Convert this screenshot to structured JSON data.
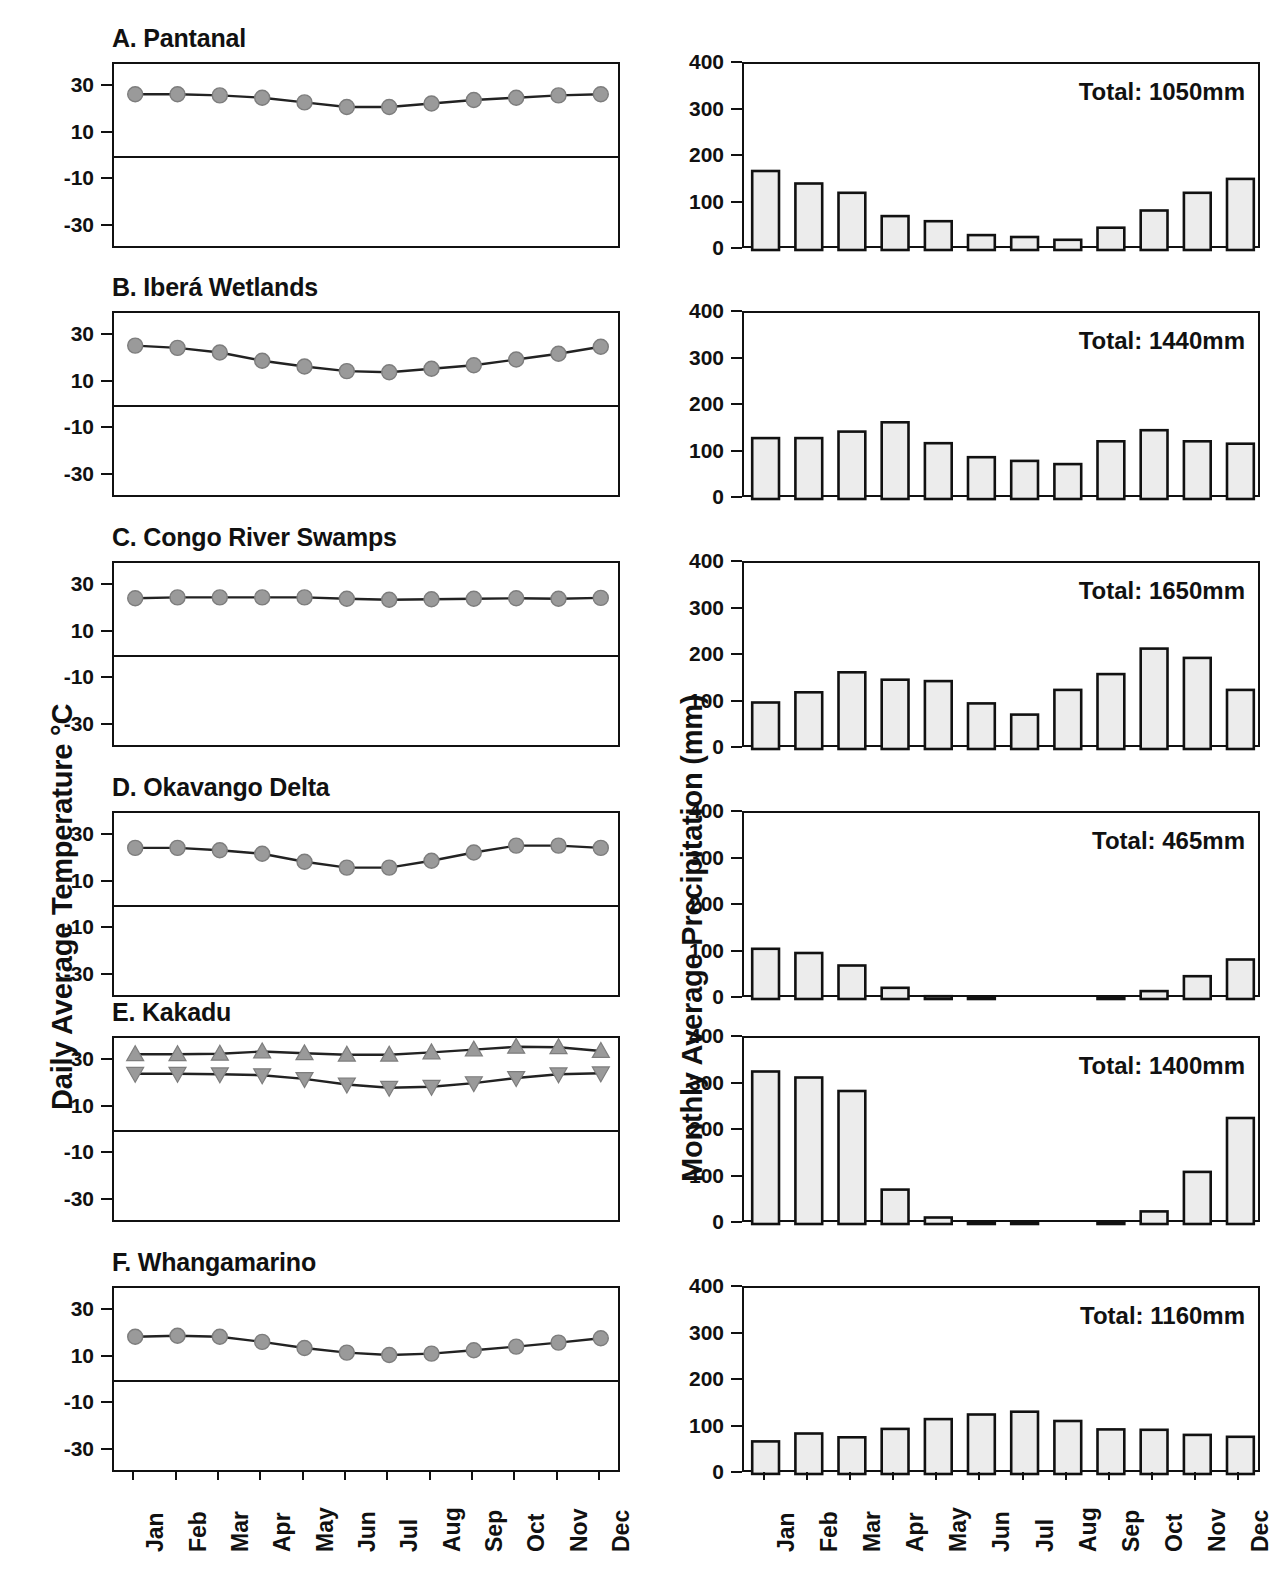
{
  "figure": {
    "temperature_axis_title": "Daily Average Temperature °C",
    "precipitation_axis_title": "Monthly Average Precipitation (mm)",
    "months": [
      "Jan",
      "Feb",
      "Mar",
      "Apr",
      "May",
      "Jun",
      "Jul",
      "Aug",
      "Sep",
      "Oct",
      "Nov",
      "Dec"
    ],
    "temp_ticks": [
      30,
      10,
      -10,
      -30
    ],
    "temp_tick_labels": [
      "30",
      "10",
      "-10",
      "-30"
    ],
    "precip_ticks": [
      400,
      300,
      200,
      100,
      0
    ],
    "precip_tick_labels": [
      "400",
      "300",
      "200",
      "100",
      "0"
    ],
    "temp_ylim": [
      -40,
      40
    ],
    "precip_ylim": [
      0,
      400
    ],
    "marker_color": "#9a9a9a",
    "line_color": "#222222",
    "bar_fill": "#ececec",
    "bar_edge": "#111111",
    "panel_titles": {
      "a": "A. Pantanal",
      "b": "B. Iberá Wetlands",
      "c": "C. Congo River Swamps",
      "d": "D. Okavango Delta",
      "e": "E. Kakadu",
      "f": "F. Whangamarino"
    },
    "totals": {
      "a": "Total:  1050mm",
      "b": "Total:  1440mm",
      "c": "Total:  1650mm",
      "d": "Total:  465mm",
      "e": "Total:  1400mm",
      "f": "Total:  1160mm"
    }
  },
  "chart_data": [
    {
      "type": "line",
      "panel": "A",
      "title": "A. Pantanal",
      "ylabel": "Daily Average Temperature °C",
      "xlabel": "",
      "categories": [
        "Jan",
        "Feb",
        "Mar",
        "Apr",
        "May",
        "Jun",
        "Jul",
        "Aug",
        "Sep",
        "Oct",
        "Nov",
        "Dec"
      ],
      "series": [
        {
          "name": "Daily average temperature",
          "marker": "circle",
          "values": [
            27.0,
            27.0,
            26.5,
            25.5,
            23.5,
            21.5,
            21.5,
            23.0,
            24.5,
            25.5,
            26.5,
            27.0
          ]
        }
      ],
      "ylim": [
        -40,
        40
      ],
      "yticks": [
        30,
        10,
        -10,
        -30
      ],
      "grid": false,
      "legend": "none"
    },
    {
      "type": "bar",
      "panel": "A",
      "title": "A. Pantanal",
      "annotation": "Total:  1050mm",
      "ylabel": "Monthly Average Precipitation (mm)",
      "categories": [
        "Jan",
        "Feb",
        "Mar",
        "Apr",
        "May",
        "Jun",
        "Jul",
        "Aug",
        "Sep",
        "Oct",
        "Nov",
        "Dec"
      ],
      "values": [
        170,
        143,
        123,
        73,
        62,
        32,
        28,
        22,
        48,
        85,
        123,
        153
      ],
      "ylim": [
        0,
        400
      ],
      "yticks": [
        0,
        100,
        200,
        300,
        400
      ],
      "grid": false
    },
    {
      "type": "line",
      "panel": "B",
      "title": "B. Iberá Wetlands",
      "ylabel": "Daily Average Temperature °C",
      "categories": [
        "Jan",
        "Feb",
        "Mar",
        "Apr",
        "May",
        "Jun",
        "Jul",
        "Aug",
        "Sep",
        "Oct",
        "Nov",
        "Dec"
      ],
      "series": [
        {
          "name": "Daily average temperature",
          "marker": "circle",
          "values": [
            26.0,
            25.0,
            23.0,
            19.5,
            17.0,
            15.0,
            14.5,
            16.0,
            17.5,
            20.0,
            22.5,
            25.5
          ]
        }
      ],
      "ylim": [
        -40,
        40
      ],
      "yticks": [
        30,
        10,
        -10,
        -30
      ],
      "grid": false,
      "legend": "none"
    },
    {
      "type": "bar",
      "panel": "B",
      "title": "B. Iberá Wetlands",
      "annotation": "Total:  1440mm",
      "ylabel": "Monthly Average Precipitation (mm)",
      "categories": [
        "Jan",
        "Feb",
        "Mar",
        "Apr",
        "May",
        "Jun",
        "Jul",
        "Aug",
        "Sep",
        "Oct",
        "Nov",
        "Dec"
      ],
      "values": [
        131,
        131,
        145,
        165,
        120,
        90,
        82,
        75,
        124,
        148,
        124,
        119
      ],
      "ylim": [
        0,
        400
      ],
      "yticks": [
        0,
        100,
        200,
        300,
        400
      ],
      "grid": false
    },
    {
      "type": "line",
      "panel": "C",
      "title": "C. Congo River Swamps",
      "ylabel": "Daily Average Temperature °C",
      "categories": [
        "Jan",
        "Feb",
        "Mar",
        "Apr",
        "May",
        "Jun",
        "Jul",
        "Aug",
        "Sep",
        "Oct",
        "Nov",
        "Dec"
      ],
      "series": [
        {
          "name": "Daily average temperature",
          "marker": "circle",
          "values": [
            24.8,
            25.2,
            25.2,
            25.2,
            25.2,
            24.6,
            24.2,
            24.4,
            24.6,
            24.8,
            24.6,
            25.0
          ]
        }
      ],
      "ylim": [
        -40,
        40
      ],
      "yticks": [
        30,
        10,
        -10,
        -30
      ],
      "grid": false,
      "legend": "none"
    },
    {
      "type": "bar",
      "panel": "C",
      "title": "C. Congo River Swamps",
      "annotation": "Total:  1650mm",
      "ylabel": "Monthly Average Precipitation (mm)",
      "categories": [
        "Jan",
        "Feb",
        "Mar",
        "Apr",
        "May",
        "Jun",
        "Jul",
        "Aug",
        "Sep",
        "Oct",
        "Nov",
        "Dec"
      ],
      "values": [
        100,
        122,
        165,
        149,
        146,
        98,
        74,
        127,
        161,
        216,
        196,
        127
      ],
      "ylim": [
        0,
        400
      ],
      "yticks": [
        0,
        100,
        200,
        300,
        400
      ],
      "grid": false
    },
    {
      "type": "line",
      "panel": "D",
      "title": "D. Okavango Delta",
      "ylabel": "Daily Average Temperature °C",
      "categories": [
        "Jan",
        "Feb",
        "Mar",
        "Apr",
        "May",
        "Jun",
        "Jul",
        "Aug",
        "Sep",
        "Oct",
        "Nov",
        "Dec"
      ],
      "series": [
        {
          "name": "Daily average temperature",
          "marker": "circle",
          "values": [
            25.0,
            25.0,
            24.0,
            22.5,
            19.0,
            16.5,
            16.5,
            19.5,
            23.0,
            26.0,
            26.0,
            25.0
          ]
        }
      ],
      "ylim": [
        -40,
        40
      ],
      "yticks": [
        30,
        10,
        -10,
        -30
      ],
      "grid": false,
      "legend": "none"
    },
    {
      "type": "bar",
      "panel": "D",
      "title": "D. Okavango Delta",
      "annotation": "Total:  465mm",
      "ylabel": "Monthly Average Precipitation (mm)",
      "categories": [
        "Jan",
        "Feb",
        "Mar",
        "Apr",
        "May",
        "Jun",
        "Jul",
        "Aug",
        "Sep",
        "Oct",
        "Nov",
        "Dec"
      ],
      "values": [
        108,
        99,
        72,
        24,
        6,
        1,
        0,
        0,
        2,
        17,
        49,
        85
      ],
      "ylim": [
        0,
        400
      ],
      "yticks": [
        0,
        100,
        200,
        300,
        400
      ],
      "grid": false
    },
    {
      "type": "line",
      "panel": "E",
      "title": "E. Kakadu",
      "ylabel": "Daily Average Temperature °C",
      "categories": [
        "Jan",
        "Feb",
        "Mar",
        "Apr",
        "May",
        "Jun",
        "Jul",
        "Aug",
        "Sep",
        "Oct",
        "Nov",
        "Dec"
      ],
      "series": [
        {
          "name": "Daily maximum temperature",
          "marker": "triangle-up",
          "values": [
            33.0,
            33.0,
            33.2,
            34.2,
            33.4,
            32.8,
            32.8,
            33.8,
            35.0,
            36.2,
            36.0,
            34.4
          ]
        },
        {
          "name": "Daily minimum temperature",
          "marker": "triangle-down",
          "values": [
            24.6,
            24.6,
            24.4,
            24.0,
            22.4,
            20.0,
            18.6,
            19.0,
            20.6,
            22.8,
            24.4,
            24.8
          ]
        }
      ],
      "ylim": [
        -40,
        40
      ],
      "yticks": [
        30,
        10,
        -10,
        -30
      ],
      "grid": false,
      "legend": "none"
    },
    {
      "type": "bar",
      "panel": "E",
      "title": "E. Kakadu",
      "annotation": "Total:  1400mm",
      "ylabel": "Monthly Average Precipitation (mm)",
      "categories": [
        "Jan",
        "Feb",
        "Mar",
        "Apr",
        "May",
        "Jun",
        "Jul",
        "Aug",
        "Sep",
        "Oct",
        "Nov",
        "Dec"
      ],
      "values": [
        328,
        315,
        286,
        74,
        14,
        1,
        3,
        0,
        5,
        27,
        112,
        228
      ],
      "ylim": [
        0,
        400
      ],
      "yticks": [
        0,
        100,
        200,
        300,
        400
      ],
      "grid": false
    },
    {
      "type": "line",
      "panel": "F",
      "title": "F. Whangamarino",
      "ylabel": "Daily Average Temperature °C",
      "categories": [
        "Jan",
        "Feb",
        "Mar",
        "Apr",
        "May",
        "Jun",
        "Jul",
        "Aug",
        "Sep",
        "Oct",
        "Nov",
        "Dec"
      ],
      "series": [
        {
          "name": "Daily average temperature",
          "marker": "circle",
          "values": [
            19.0,
            19.5,
            19.0,
            16.8,
            14.2,
            12.2,
            11.2,
            11.8,
            13.2,
            14.8,
            16.5,
            18.4
          ]
        }
      ],
      "ylim": [
        -40,
        40
      ],
      "yticks": [
        30,
        10,
        -10,
        -30
      ],
      "grid": false,
      "legend": "none"
    },
    {
      "type": "bar",
      "panel": "F",
      "title": "F. Whangamarino",
      "annotation": "Total:  1160mm",
      "ylabel": "Monthly Average Precipitation (mm)",
      "categories": [
        "Jan",
        "Feb",
        "Mar",
        "Apr",
        "May",
        "Jun",
        "Jul",
        "Aug",
        "Sep",
        "Oct",
        "Nov",
        "Dec"
      ],
      "values": [
        70,
        87,
        79,
        97,
        118,
        128,
        134,
        114,
        96,
        95,
        84,
        80
      ],
      "ylim": [
        0,
        400
      ],
      "yticks": [
        0,
        100,
        200,
        300,
        400
      ],
      "grid": false
    }
  ]
}
